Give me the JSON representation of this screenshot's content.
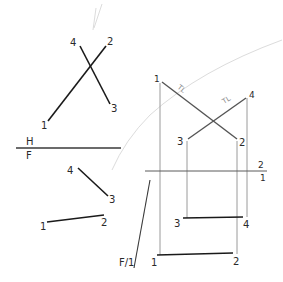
{
  "diagram": {
    "type": "descriptive-geometry-projection",
    "colors": {
      "object_line": "#1a1a1a",
      "true_length_line": "#555555",
      "projector_line": "#9a9a9a",
      "fold_line": "#3a3a3a",
      "construction_faint": "#d6d6d6"
    },
    "top_view": {
      "fold_label_top": "H",
      "fold_label_bottom": "F",
      "points": {
        "p1": "1",
        "p2": "2",
        "p3": "3",
        "p4": "4"
      }
    },
    "front_view": {
      "points": {
        "p1": "1",
        "p2": "2",
        "p3": "3",
        "p4": "4"
      }
    },
    "auxiliary_fold": {
      "label": "F/1"
    },
    "auxiliary_view_1": {
      "points": {
        "p1": "1",
        "p2": "2",
        "p3": "3",
        "p4": "4"
      },
      "true_length_marks": [
        "TL",
        "TL"
      ]
    },
    "secondary_fold": {
      "label_top": "2",
      "label_bottom": "1"
    },
    "auxiliary_view_2": {
      "points": {
        "p1": "1",
        "p2": "2",
        "p3": "3",
        "p4": "4"
      }
    }
  }
}
